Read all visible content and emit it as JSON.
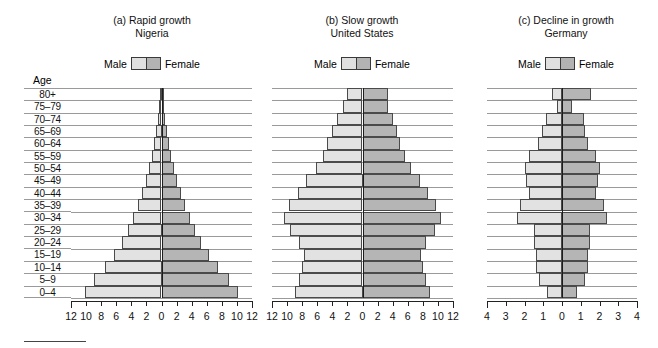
{
  "figure": {
    "age_axis_label": "Age",
    "age_groups": [
      "80+",
      "75–79",
      "70–74",
      "65–69",
      "60–64",
      "55–59",
      "50–54",
      "45–49",
      "40–44",
      "35–39",
      "30–34",
      "25–29",
      "20–24",
      "15–19",
      "10–14",
      "5–9",
      "0–4"
    ],
    "legend": {
      "male_label": "Male",
      "female_label": "Female"
    },
    "colors": {
      "male": "#e2e2e2",
      "female": "#b5b5b5",
      "outline": "#4a4a4a",
      "grid": "#9a9a9a",
      "axis": "#222222"
    }
  },
  "panels": [
    {
      "id": "nigeria",
      "label": "(a) Rapid growth",
      "country": "Nigeria",
      "axis_max": 12,
      "tick_step": 2,
      "tick_labels": [
        "12",
        "10",
        "8",
        "6",
        "4",
        "2",
        "0",
        "2",
        "4",
        "6",
        "8",
        "10",
        "12"
      ]
    },
    {
      "id": "united-states",
      "label": "(b) Slow growth",
      "country": "United States",
      "axis_max": 12,
      "tick_step": 2,
      "tick_labels": [
        "12",
        "10",
        "8",
        "6",
        "4",
        "2",
        "0",
        "2",
        "4",
        "6",
        "8",
        "10",
        "12"
      ]
    },
    {
      "id": "germany",
      "label": "(c) Decline in growth",
      "country": "Germany",
      "axis_max": 4,
      "tick_step": 1,
      "tick_labels": [
        "4",
        "3",
        "2",
        "1",
        "0",
        "1",
        "2",
        "3",
        "4"
      ]
    }
  ],
  "chart_data": [
    {
      "type": "bar",
      "subtype": "population-pyramid",
      "title": "(a) Rapid growth",
      "subtitle": "Nigeria",
      "xlabel": "Percent of population",
      "ylabel": "Age",
      "xlim": [
        -12,
        12
      ],
      "grid": true,
      "legend_position": "top",
      "categories": [
        "80+",
        "75–79",
        "70–74",
        "65–69",
        "60–64",
        "55–59",
        "50–54",
        "45–49",
        "40–44",
        "35–39",
        "30–34",
        "25–29",
        "20–24",
        "15–19",
        "10–14",
        "5–9",
        "0–4"
      ],
      "series": [
        {
          "name": "Male",
          "values": [
            0.15,
            0.3,
            0.5,
            0.75,
            1.0,
            1.3,
            1.7,
            2.1,
            2.6,
            3.1,
            3.8,
            4.5,
            5.3,
            6.3,
            7.5,
            9.0,
            10.2
          ]
        },
        {
          "name": "Female",
          "values": [
            0.15,
            0.3,
            0.5,
            0.75,
            1.0,
            1.3,
            1.7,
            2.1,
            2.6,
            3.1,
            3.8,
            4.5,
            5.3,
            6.3,
            7.5,
            9.0,
            10.2
          ]
        }
      ]
    },
    {
      "type": "bar",
      "subtype": "population-pyramid",
      "title": "(b) Slow growth",
      "subtitle": "United States",
      "xlabel": "Percent of population",
      "ylabel": "Age",
      "xlim": [
        -12,
        12
      ],
      "grid": true,
      "legend_position": "top",
      "categories": [
        "80+",
        "75–79",
        "70–74",
        "65–69",
        "60–64",
        "55–59",
        "50–54",
        "45–49",
        "40–44",
        "35–39",
        "30–34",
        "25–29",
        "20–24",
        "15–19",
        "10–14",
        "5–9",
        "0–4"
      ],
      "series": [
        {
          "name": "Male",
          "values": [
            2.0,
            2.6,
            3.4,
            4.1,
            4.7,
            5.3,
            6.2,
            7.5,
            8.6,
            9.7,
            10.4,
            9.6,
            8.4,
            7.8,
            8.0,
            8.4,
            9.0
          ]
        },
        {
          "name": "Female",
          "values": [
            3.4,
            3.4,
            4.0,
            4.6,
            5.0,
            5.6,
            6.4,
            7.6,
            8.7,
            9.8,
            10.4,
            9.6,
            8.4,
            7.8,
            8.0,
            8.4,
            9.0
          ]
        }
      ]
    },
    {
      "type": "bar",
      "subtype": "population-pyramid",
      "title": "(c) Decline in growth",
      "subtitle": "Germany",
      "xlabel": "Percent of population",
      "ylabel": "Age",
      "xlim": [
        -4,
        4
      ],
      "grid": true,
      "legend_position": "top",
      "categories": [
        "80+",
        "75–79",
        "70–74",
        "65–69",
        "60–64",
        "55–59",
        "50–54",
        "45–49",
        "40–44",
        "35–39",
        "30–34",
        "25–29",
        "20–24",
        "15–19",
        "10–14",
        "5–9",
        "0–4"
      ],
      "series": [
        {
          "name": "Male",
          "values": [
            0.55,
            0.25,
            0.85,
            1.05,
            1.3,
            1.75,
            2.0,
            1.9,
            1.75,
            2.25,
            2.4,
            1.5,
            1.5,
            1.4,
            1.4,
            1.25,
            0.8
          ]
        },
        {
          "name": "Female",
          "values": [
            1.55,
            0.55,
            1.15,
            1.25,
            1.4,
            1.8,
            2.0,
            1.9,
            1.8,
            2.25,
            2.4,
            1.5,
            1.5,
            1.4,
            1.4,
            1.25,
            0.8
          ]
        }
      ]
    }
  ]
}
